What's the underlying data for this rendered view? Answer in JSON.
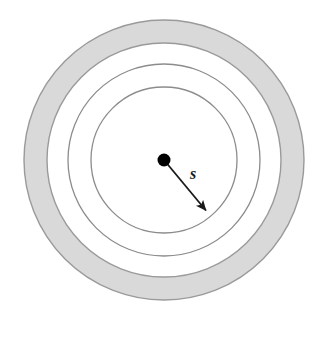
{
  "figure": {
    "title": "Concentric circles diagram with radius vector",
    "background_color": "#ffffff",
    "width": 318,
    "height": 338,
    "center": {
      "x": 164,
      "y": 160
    },
    "shaded_band_fill": "#d9d9d9",
    "circle_stroke_color": "#8c8c8c",
    "band_stroke_color": "#9a9a9a",
    "center_dot_color": "#000000",
    "arrow_color": "#1a1a1a"
  },
  "labels": {
    "radius": "s"
  },
  "rings": [
    {
      "name": "outer-shaded-annulus",
      "outer_radius": 140,
      "inner_radius": 117,
      "filled": true,
      "fill": "#d9d9d9",
      "stroke": "#9a9a9a"
    },
    {
      "name": "middle-circle",
      "radius": 96,
      "filled": false,
      "stroke": "#8c8c8c"
    },
    {
      "name": "inner-circle",
      "radius": 73,
      "filled": false,
      "stroke": "#8c8c8c"
    }
  ],
  "center_dot": {
    "name": "center-point",
    "radius": 6.5,
    "color": "#000000"
  },
  "radius_arrow": {
    "name": "radius-arrow",
    "from": {
      "x": 164,
      "y": 160
    },
    "to": {
      "x": 208,
      "y": 213
    },
    "label": "s",
    "label_position": {
      "x": 193,
      "y": 179
    },
    "color": "#1a1a1a",
    "stroke_width": 1.8
  }
}
